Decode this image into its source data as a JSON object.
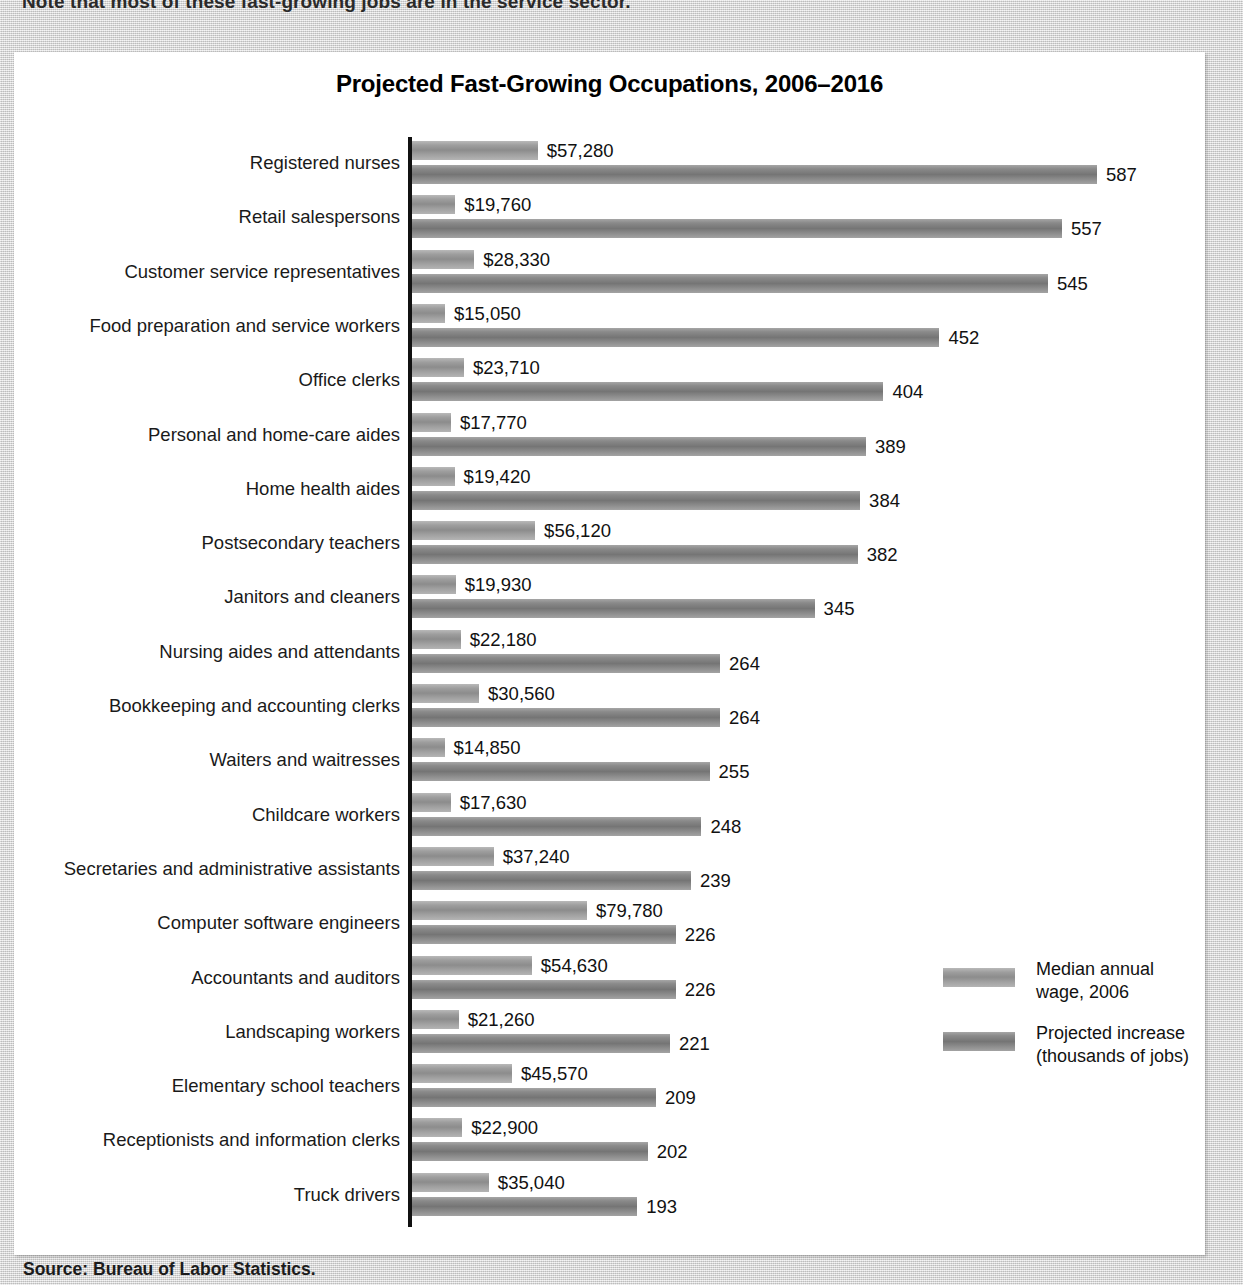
{
  "intro_text": "Note that most of these fast-growing jobs are in the service sector.",
  "chart_title": "Projected Fast-Growing Occupations, 2006–2016",
  "source_note": "Source: Bureau of Labor Statistics.",
  "legend": {
    "items": [
      {
        "key": "wage",
        "label": "Median annual\nwage, 2006"
      },
      {
        "key": "jobs",
        "label": "Projected increase\n(thousands of jobs)"
      }
    ]
  },
  "colors": {
    "wage_bar": "#9e9e9e",
    "jobs_bar": "#7d7d7d",
    "axis": "#111111",
    "panel_background": "#ffffff",
    "page_background": "#d8d8d8"
  },
  "chart_data": {
    "type": "bar",
    "orientation": "horizontal",
    "title": "Projected Fast-Growing Occupations, 2006–2016",
    "xlabel": "",
    "ylabel": "",
    "grid": false,
    "legend_position": "right-bottom",
    "note": "Two independently scaled series share each category row; no numeric axis ticks are drawn, values are printed at bar ends.",
    "categories": [
      "Registered nurses",
      "Retail salespersons",
      "Customer service representatives",
      "Food preparation and service workers",
      "Office clerks",
      "Personal and home-care aides",
      "Home health aides",
      "Postsecondary teachers",
      "Janitors and cleaners",
      "Nursing aides and attendants",
      "Bookkeeping and accounting clerks",
      "Waiters and waitresses",
      "Childcare workers",
      "Secretaries and administrative assistants",
      "Computer software engineers",
      "Accountants and auditors",
      "Landscaping workers",
      "Elementary school teachers",
      "Receptionists and information clerks",
      "Truck drivers"
    ],
    "series": [
      {
        "name": "Median annual wage, 2006",
        "unit": "USD",
        "values": [
          57280,
          19760,
          28330,
          15050,
          23710,
          17770,
          19420,
          56120,
          19930,
          22180,
          30560,
          14850,
          17630,
          37240,
          79780,
          54630,
          21260,
          45570,
          22900,
          35040
        ],
        "labels": [
          "$57,280",
          "$19,760",
          "$28,330",
          "$15,050",
          "$23,710",
          "$17,770",
          "$19,420",
          "$56,120",
          "$19,930",
          "$22,180",
          "$30,560",
          "$14,850",
          "$17,630",
          "$37,240",
          "$79,780",
          "$54,630",
          "$21,260",
          "$45,570",
          "$22,900",
          "$35,040"
        ],
        "max": 79780
      },
      {
        "name": "Projected increase (thousands of jobs)",
        "unit": "thousands of jobs",
        "values": [
          587,
          557,
          545,
          452,
          404,
          389,
          384,
          382,
          345,
          264,
          264,
          255,
          248,
          239,
          226,
          226,
          221,
          209,
          202,
          193
        ],
        "labels": [
          "587",
          "557",
          "545",
          "452",
          "404",
          "389",
          "384",
          "382",
          "345",
          "264",
          "264",
          "255",
          "248",
          "239",
          "226",
          "226",
          "221",
          "209",
          "202",
          "193"
        ],
        "max": 587
      }
    ]
  }
}
